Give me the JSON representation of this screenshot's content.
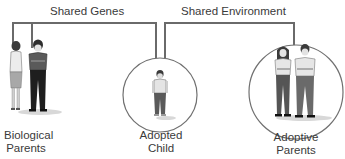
{
  "diagram": {
    "connectors": {
      "shared_genes": {
        "label": "Shared Genes"
      },
      "shared_environment": {
        "label": "Shared Environment"
      }
    },
    "groups": [
      {
        "id": "biological-parents",
        "label_line1": "Biological",
        "label_line2": "Parents",
        "encircled": false
      },
      {
        "id": "adopted-child",
        "label_line1": "Adopted",
        "label_line2": "Child",
        "encircled": true
      },
      {
        "id": "adoptive-parents",
        "label_line1": "Adoptive",
        "label_line2": "Parents",
        "encircled": true
      }
    ]
  },
  "colors": {
    "line": "#555555",
    "text": "#3a3a3a",
    "circle": "#666666"
  }
}
